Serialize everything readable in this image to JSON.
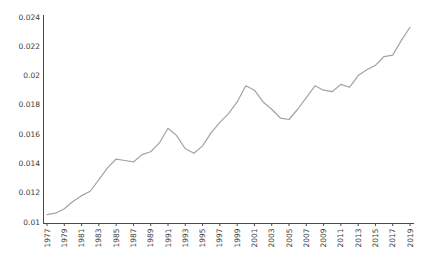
{
  "figure": {
    "width": 428,
    "height": 263,
    "background": "#ffffff"
  },
  "chart_data": {
    "type": "line",
    "title": "",
    "xlabel": "",
    "ylabel": "",
    "x": [
      1977,
      1978,
      1979,
      1980,
      1981,
      1982,
      1983,
      1984,
      1985,
      1986,
      1987,
      1988,
      1989,
      1990,
      1991,
      1992,
      1993,
      1994,
      1995,
      1996,
      1997,
      1998,
      1999,
      2000,
      2001,
      2002,
      2003,
      2004,
      2005,
      2006,
      2007,
      2008,
      2009,
      2010,
      2011,
      2012,
      2013,
      2014,
      2015,
      2016,
      2017,
      2018,
      2019
    ],
    "values": [
      0.0105,
      0.0106,
      0.0109,
      0.0114,
      0.0118,
      0.0121,
      0.0129,
      0.0137,
      0.0143,
      0.0142,
      0.0141,
      0.0146,
      0.0148,
      0.0154,
      0.0164,
      0.0159,
      0.015,
      0.0147,
      0.0152,
      0.0161,
      0.0168,
      0.0174,
      0.0182,
      0.0193,
      0.019,
      0.0182,
      0.0177,
      0.0171,
      0.017,
      0.0177,
      0.0185,
      0.0193,
      0.019,
      0.0189,
      0.0194,
      0.0192,
      0.02,
      0.0204,
      0.0207,
      0.0213,
      0.0214,
      0.0224,
      0.0233
    ],
    "xlim": [
      1977,
      2019
    ],
    "ylim": [
      0.01,
      0.024
    ],
    "x_tick_labels": [
      "1977",
      "1979",
      "1981",
      "1983",
      "1985",
      "1987",
      "1989",
      "1991",
      "1993",
      "1995",
      "1997",
      "1999",
      "2001",
      "2003",
      "2005",
      "2007",
      "2009",
      "2011",
      "2013",
      "2015",
      "2017",
      "2019"
    ],
    "y_tick_labels": [
      "0.01",
      "0.012",
      "0.014",
      "0.016",
      "0.018",
      "0.02",
      "0.022",
      "0.024"
    ],
    "grid": false,
    "legend_position": "none",
    "line_color": "#a3a3a3",
    "axis_color": "#4a4a4a",
    "text_color": "#3a3a3a"
  }
}
